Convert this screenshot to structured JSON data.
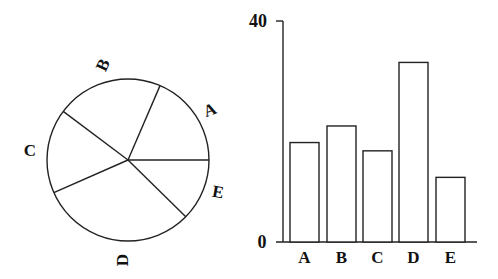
{
  "chart_data": [
    {
      "type": "pie",
      "title": "",
      "categories": [
        "A",
        "B",
        "C",
        "D",
        "E"
      ],
      "values": [
        18.5,
        21.2,
        16.8,
        31.1,
        12.4
      ],
      "angles_deg": [
        66.7,
        76.4,
        60.6,
        111.8,
        44.5
      ],
      "start_angle_deg": 0,
      "direction": "counterclockwise",
      "labels_outside": true
    },
    {
      "type": "bar",
      "title": "",
      "categories": [
        "A",
        "B",
        "C",
        "D",
        "E"
      ],
      "values": [
        18,
        21,
        16.5,
        32.5,
        11.7
      ],
      "xlabel": "",
      "ylabel": "",
      "ylim": [
        0,
        40
      ],
      "yticks": [
        "0",
        "40"
      ],
      "grid": false,
      "legend": null
    }
  ],
  "pie": {
    "labels": [
      "A",
      "B",
      "C",
      "D",
      "E"
    ]
  },
  "bar": {
    "ytick_top": "40",
    "ytick_bottom": "0",
    "xlabels": [
      "A",
      "B",
      "C",
      "D",
      "E"
    ]
  }
}
